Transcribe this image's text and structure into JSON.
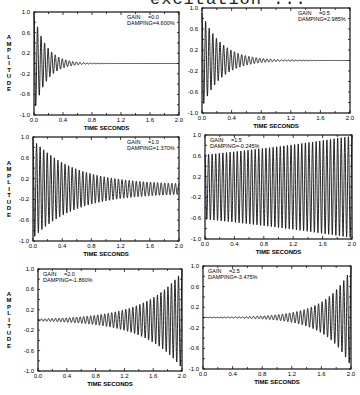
{
  "figure": {
    "title_fragment": "excitation ...",
    "x_axis_label": "TIME SECONDS",
    "y_axis_label": "AMPLITUDE"
  },
  "chart_data": [
    {
      "type": "line",
      "title": "",
      "annotation": {
        "gain_label": "GAIN",
        "gain_value": "=0.0",
        "damping_label": "DAMPING=",
        "damping_value": "4.600%"
      },
      "gain": 0.0,
      "damping_percent": 4.6,
      "xlabel": "TIME SECONDS",
      "ylabel": "AMPLITUDE",
      "xlim": [
        0.0,
        2.0
      ],
      "ylim": [
        -1.0,
        1.0
      ],
      "xticks": [
        "0.0",
        "0.4",
        "0.8",
        "1.2",
        "1.6",
        "2.0"
      ],
      "yticks": [
        "1.0",
        "0.6",
        "0.2",
        "-0.2",
        "-0.6",
        "-1.0"
      ],
      "initial_amplitude": 0.95,
      "final_amplitude": 0.0,
      "grid": false
    },
    {
      "type": "line",
      "annotation": {
        "gain_label": "GAIN",
        "gain_value": "=0.5",
        "damping_label": "DAMPING=",
        "damping_value": "2.985%"
      },
      "gain": 0.5,
      "damping_percent": 2.985,
      "xlabel": "TIME SECONDS",
      "ylabel": "",
      "xlim": [
        0.0,
        2.0
      ],
      "ylim": [
        -1.0,
        1.0
      ],
      "xticks": [
        "0.0",
        "0.4",
        "0.8",
        "1.2",
        "1.6",
        "2.0"
      ],
      "yticks": [
        "1.0",
        "0.6",
        "0.2",
        "-0.2",
        "-0.6",
        "-1.0"
      ],
      "initial_amplitude": 0.9,
      "final_amplitude": 0.0,
      "grid": false
    },
    {
      "type": "line",
      "annotation": {
        "gain_label": "GAIN",
        "gain_value": "=1.0",
        "damping_label": "DAMPING=",
        "damping_value": "1.370%"
      },
      "gain": 1.0,
      "damping_percent": 1.37,
      "xlabel": "TIME SECONDS",
      "ylabel": "AMPLITUDE",
      "xlim": [
        0.0,
        2.0
      ],
      "ylim": [
        -1.0,
        1.0
      ],
      "xticks": [
        "0.0",
        "0.4",
        "0.8",
        "1.2",
        "1.6",
        "2.0"
      ],
      "yticks": [
        "1.0",
        "0.6",
        "0.2",
        "-0.2",
        "-0.6",
        "-1.0"
      ],
      "initial_amplitude": 0.95,
      "final_amplitude": 0.08,
      "grid": false
    },
    {
      "type": "line",
      "annotation": {
        "gain_label": "GAIN",
        "gain_value": "=1.5",
        "damping_label": "DAMPING=",
        "damping_value": "-0.245%"
      },
      "gain": 1.5,
      "damping_percent": -0.245,
      "xlabel": "TIME SECONDS",
      "ylabel": "",
      "xlim": [
        0.0,
        2.0
      ],
      "ylim": [
        -1.0,
        1.0
      ],
      "xticks": [
        "0.0",
        "0.4",
        "0.8",
        "1.2",
        "1.6",
        "2.0"
      ],
      "yticks": [
        "1.0",
        "0.6",
        "0.2",
        "-0.2",
        "-0.6",
        "-1.0"
      ],
      "initial_amplitude": 0.62,
      "final_amplitude": 0.98,
      "grid": false
    },
    {
      "type": "line",
      "annotation": {
        "gain_label": "GAIN",
        "gain_value": "=2.0",
        "damping_label": "DAMPING=",
        "damping_value": "-1.860%"
      },
      "gain": 2.0,
      "damping_percent": -1.86,
      "xlabel": "TIME SECONDS",
      "ylabel": "AMPLITUDE",
      "xlim": [
        0.0,
        2.0
      ],
      "ylim": [
        -1.0,
        1.0
      ],
      "xticks": [
        "0.0",
        "0.4",
        "0.8",
        "1.2",
        "1.6",
        "2.0"
      ],
      "yticks": [
        "1.0",
        "0.6",
        "0.2",
        "-0.2",
        "-0.6",
        "-1.0"
      ],
      "initial_amplitude": 0.02,
      "final_amplitude": 0.95,
      "grid": false
    },
    {
      "type": "line",
      "annotation": {
        "gain_label": "GAIN",
        "gain_value": "=2.5",
        "damping_label": "DAMPING=",
        "damping_value": "-3.475%"
      },
      "gain": 2.5,
      "damping_percent": -3.475,
      "xlabel": "TIME SECONDS",
      "ylabel": "",
      "xlim": [
        0.0,
        2.0
      ],
      "ylim": [
        -1.0,
        1.0
      ],
      "xticks": [
        "0.0",
        "0.4",
        "0.8",
        "1.2",
        "1.6",
        "2.0"
      ],
      "yticks": [
        "1.0",
        "0.6",
        "0.2",
        "-0.2",
        "-0.6",
        "-1.0"
      ],
      "initial_amplitude": 0.0,
      "final_amplitude": 0.95,
      "grid": false
    }
  ]
}
